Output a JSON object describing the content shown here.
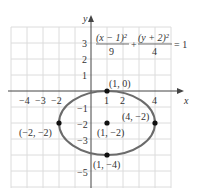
{
  "diagram": {
    "equation": {
      "term1_num": "(x − 1)²",
      "term1_den": "9",
      "plus": "+",
      "term2_num": "(y + 2)²",
      "term2_den": "4",
      "rhs": "= 1"
    },
    "axes": {
      "x_label": "x",
      "y_label": "y",
      "x_ticks": [
        "−4",
        "−3",
        "−2",
        "1",
        "2",
        "4"
      ],
      "y_ticks": [
        "3",
        "2",
        "1",
        "−1",
        "−2",
        "−3",
        "−5"
      ]
    },
    "points": [
      {
        "label": "(1, 0)"
      },
      {
        "label": "(−2, −2)"
      },
      {
        "label": "(1, −2)"
      },
      {
        "label": "(4, −2)"
      },
      {
        "label": "(1, −4)"
      }
    ],
    "colors": {
      "curve": "#6b6b6b",
      "grid": "#d9d9d9",
      "axis": "#444444",
      "point": "#111111"
    }
  }
}
